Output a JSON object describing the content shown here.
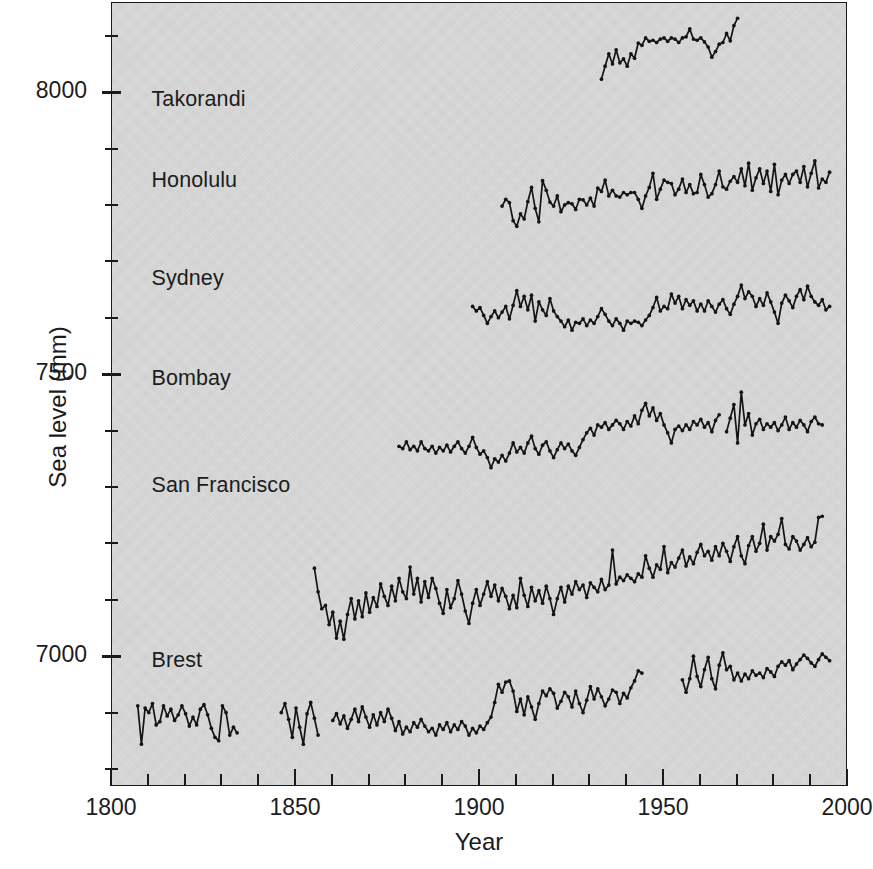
{
  "chart_data": {
    "type": "line",
    "title": "",
    "subtitle": "",
    "xlabel": "Year",
    "ylabel": "Sea level (mm)",
    "xlim": [
      1800,
      2000
    ],
    "ylim": [
      6770,
      8160
    ],
    "x_ticks_major": [
      1800,
      1850,
      1900,
      1950,
      2000
    ],
    "x_ticks_minor": [
      1810,
      1820,
      1830,
      1840,
      1860,
      1870,
      1880,
      1890,
      1910,
      1920,
      1930,
      1940,
      1960,
      1970,
      1980,
      1990
    ],
    "y_ticks_major": [
      7000,
      7500,
      8000
    ],
    "y_ticks_minor": [
      6800,
      6900,
      7100,
      7200,
      7300,
      7400,
      7600,
      7700,
      7800,
      7900,
      8100
    ],
    "grid": false,
    "legend_position": "inline-left-of-series",
    "background_color": "#d6d6d6",
    "line_color": "#141414",
    "marker": "filled-circle",
    "series": [
      {
        "name": "Takorandi",
        "label_x": 1811,
        "label_y": 7985,
        "x_start": 1933,
        "x_end": 1970,
        "values": [
          8025,
          8048,
          8070,
          8052,
          8077,
          8054,
          8061,
          8048,
          8070,
          8062,
          8089,
          8085,
          8098,
          8092,
          8094,
          8090,
          8096,
          8098,
          8092,
          8098,
          8096,
          8090,
          8098,
          8100,
          8114,
          8096,
          8094,
          8098,
          8091,
          8082,
          8064,
          8074,
          8087,
          8090,
          8106,
          8093,
          8120,
          8133
        ]
      },
      {
        "name": "Honolulu",
        "label_x": 1811,
        "label_y": 7840,
        "x_start": 1906,
        "x_end": 1995,
        "values": [
          7800,
          7812,
          7806,
          7774,
          7764,
          7786,
          7777,
          7808,
          7833,
          7796,
          7772,
          7845,
          7828,
          7807,
          7800,
          7818,
          7790,
          7802,
          7806,
          7804,
          7794,
          7812,
          7811,
          7802,
          7814,
          7800,
          7832,
          7826,
          7846,
          7818,
          7828,
          7818,
          7816,
          7824,
          7820,
          7824,
          7824,
          7812,
          7796,
          7818,
          7833,
          7858,
          7812,
          7830,
          7846,
          7842,
          7840,
          7820,
          7830,
          7848,
          7824,
          7838,
          7822,
          7824,
          7856,
          7838,
          7816,
          7822,
          7838,
          7862,
          7834,
          7830,
          7844,
          7852,
          7842,
          7866,
          7836,
          7876,
          7828,
          7850,
          7866,
          7840,
          7862,
          7826,
          7874,
          7820,
          7846,
          7856,
          7840,
          7856,
          7862,
          7842,
          7870,
          7834,
          7858,
          7880,
          7832,
          7848,
          7842,
          7860
        ]
      },
      {
        "name": "Sydney",
        "label_x": 1811,
        "label_y": 7668,
        "x_start": 1898,
        "x_end": 1995,
        "values": [
          7622,
          7614,
          7620,
          7606,
          7592,
          7604,
          7614,
          7602,
          7612,
          7622,
          7600,
          7624,
          7650,
          7622,
          7640,
          7616,
          7642,
          7596,
          7630,
          7616,
          7606,
          7636,
          7614,
          7604,
          7596,
          7586,
          7598,
          7580,
          7594,
          7592,
          7600,
          7588,
          7598,
          7592,
          7604,
          7618,
          7608,
          7596,
          7588,
          7600,
          7592,
          7580,
          7596,
          7592,
          7596,
          7594,
          7588,
          7598,
          7606,
          7620,
          7638,
          7614,
          7622,
          7618,
          7644,
          7628,
          7640,
          7618,
          7634,
          7624,
          7632,
          7614,
          7626,
          7614,
          7632,
          7622,
          7612,
          7626,
          7634,
          7618,
          7608,
          7626,
          7640,
          7660,
          7636,
          7648,
          7640,
          7622,
          7636,
          7624,
          7646,
          7630,
          7612,
          7592,
          7628,
          7642,
          7632,
          7620,
          7640,
          7652,
          7634,
          7658,
          7640,
          7630,
          7624,
          7634,
          7616,
          7622
        ]
      },
      {
        "name": "Bombay",
        "label_x": 1811,
        "label_y": 7490,
        "x_start": 1878,
        "x_end": 1993,
        "gaps": [
          [
            1965,
            1967
          ]
        ],
        "values": [
          7374,
          7370,
          7382,
          7368,
          7374,
          7366,
          7382,
          7370,
          7366,
          7374,
          7362,
          7372,
          7366,
          7376,
          7364,
          7374,
          7382,
          7370,
          7362,
          7374,
          7390,
          7372,
          7360,
          7366,
          7354,
          7336,
          7352,
          7346,
          7358,
          7348,
          7362,
          7380,
          7364,
          7372,
          7362,
          7380,
          7392,
          7370,
          7360,
          7376,
          7382,
          7366,
          7354,
          7368,
          7380,
          7370,
          7378,
          7366,
          7358,
          7372,
          7386,
          7398,
          7406,
          7394,
          7412,
          7408,
          7416,
          7404,
          7412,
          7420,
          7414,
          7404,
          7418,
          7410,
          7428,
          7414,
          7438,
          7450,
          7428,
          7442,
          7420,
          7432,
          7412,
          7398,
          7380,
          7404,
          7410,
          7402,
          7412,
          7404,
          7418,
          7412,
          7422,
          7408,
          7416,
          7400,
          7420,
          7430,
          7412,
          7400,
          7424,
          7448,
          7380,
          7470,
          7412,
          7432,
          7394,
          7414,
          7422,
          7404,
          7414,
          7408,
          7416,
          7402,
          7412,
          7426,
          7404,
          7416,
          7408,
          7420,
          7412,
          7400,
          7418,
          7426,
          7414,
          7412
        ]
      },
      {
        "name": "San Francisco",
        "label_x": 1811,
        "label_y": 7300,
        "x_start": 1855,
        "x_end": 1995,
        "values": [
          7158,
          7116,
          7086,
          7092,
          7058,
          7080,
          7034,
          7064,
          7032,
          7076,
          7104,
          7068,
          7100,
          7072,
          7114,
          7080,
          7106,
          7090,
          7130,
          7108,
          7092,
          7126,
          7100,
          7140,
          7116,
          7104,
          7160,
          7112,
          7140,
          7098,
          7134,
          7106,
          7140,
          7122,
          7096,
          7078,
          7120,
          7088,
          7104,
          7136,
          7112,
          7082,
          7060,
          7096,
          7120,
          7092,
          7112,
          7134,
          7108,
          7128,
          7100,
          7122,
          7108,
          7086,
          7110,
          7088,
          7140,
          7110,
          7090,
          7124,
          7100,
          7118,
          7096,
          7126,
          7104,
          7076,
          7104,
          7124,
          7098,
          7126,
          7112,
          7134,
          7120,
          7128,
          7106,
          7132,
          7124,
          7116,
          7138,
          7120,
          7128,
          7190,
          7130,
          7142,
          7136,
          7146,
          7140,
          7134,
          7148,
          7142,
          7180,
          7158,
          7142,
          7164,
          7156,
          7196,
          7150,
          7168,
          7160,
          7176,
          7190,
          7162,
          7178,
          7166,
          7186,
          7200,
          7180,
          7188,
          7172,
          7196,
          7180,
          7202,
          7188,
          7170,
          7196,
          7214,
          7180,
          7166,
          7198,
          7214,
          7188,
          7202,
          7236,
          7190,
          7214,
          7206,
          7218,
          7246,
          7200,
          7192,
          7214,
          7206,
          7190,
          7200,
          7212,
          7196,
          7204,
          7248,
          7250
        ]
      },
      {
        "name": "Brest",
        "label_x": 1811,
        "label_y": 6990,
        "segments": [
          {
            "x_start": 1807,
            "x_end": 1834,
            "values": [
              6914,
              6846,
              6910,
              6902,
              6918,
              6880,
              6886,
              6914,
              6896,
              6908,
              6888,
              6898,
              6914,
              6900,
              6878,
              6894,
              6880,
              6908,
              6916,
              6898,
              6874,
              6858,
              6852,
              6914,
              6902,
              6862,
              6876,
              6866
            ]
          },
          {
            "x_start": 1846,
            "x_end": 1856,
            "values": [
              6902,
              6918,
              6890,
              6858,
              6910,
              6876,
              6846,
              6900,
              6920,
              6892,
              6862
            ]
          },
          {
            "x_start": 1860,
            "x_end": 1944,
            "values": [
              6888,
              6900,
              6882,
              6896,
              6874,
              6890,
              6908,
              6886,
              6912,
              6894,
              6876,
              6898,
              6880,
              6902,
              6886,
              6908,
              6892,
              6870,
              6886,
              6864,
              6876,
              6868,
              6884,
              6876,
              6890,
              6878,
              6868,
              6874,
              6862,
              6880,
              6872,
              6884,
              6868,
              6880,
              6872,
              6886,
              6878,
              6862,
              6874,
              6866,
              6878,
              6872,
              6884,
              6894,
              6920,
              6952,
              6938,
              6956,
              6958,
              6940,
              6904,
              6926,
              6898,
              6930,
              6912,
              6890,
              6918,
              6940,
              6932,
              6944,
              6936,
              6910,
              6922,
              6938,
              6930,
              6912,
              6940,
              6918,
              6902,
              6924,
              6948,
              6926,
              6944,
              6930,
              6914,
              6926,
              6942,
              6938,
              6918,
              6936,
              6928,
              6946,
              6958,
              6976,
              6972
            ]
          },
          {
            "x_start": 1955,
            "x_end": 1995,
            "values": [
              6960,
              6938,
              6962,
              7002,
              6966,
              6948,
              6978,
              7000,
              6962,
              6944,
              6986,
              7008,
              6978,
              6984,
              6960,
              6972,
              6958,
              6970,
              6962,
              6976,
              6968,
              6972,
              6964,
              6980,
              6974,
              6966,
              6984,
              6992,
              6986,
              6994,
              6978,
              6988,
              6996,
              7004,
              6998,
              6990,
              6984,
              6996,
              7006,
              7000,
              6994
            ]
          }
        ]
      }
    ]
  }
}
